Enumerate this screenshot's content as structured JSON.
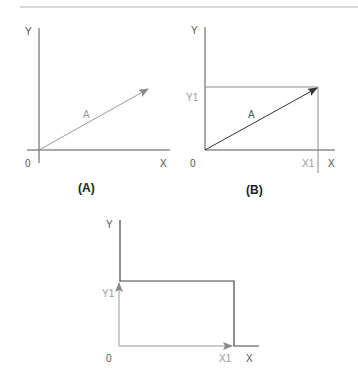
{
  "colors": {
    "axis": "#555555",
    "light": "#a8a8a8",
    "dark": "#333333",
    "rule": "#b0b0b0"
  },
  "diagrams": [
    {
      "id": "A",
      "caption": "(A)",
      "labels": {
        "y_axis": "Y",
        "x_axis": "X",
        "origin": "0",
        "vector": "A"
      }
    },
    {
      "id": "B",
      "caption": "(B)",
      "labels": {
        "y_axis": "Y",
        "x_axis": "X",
        "origin": "0",
        "vector": "A",
        "y1": "Y1",
        "x1": "X1"
      }
    },
    {
      "id": "C",
      "caption": "",
      "labels": {
        "y_axis": "Y",
        "x_axis": "X",
        "origin": "0",
        "y1": "Y1",
        "x1": "X1"
      }
    }
  ]
}
